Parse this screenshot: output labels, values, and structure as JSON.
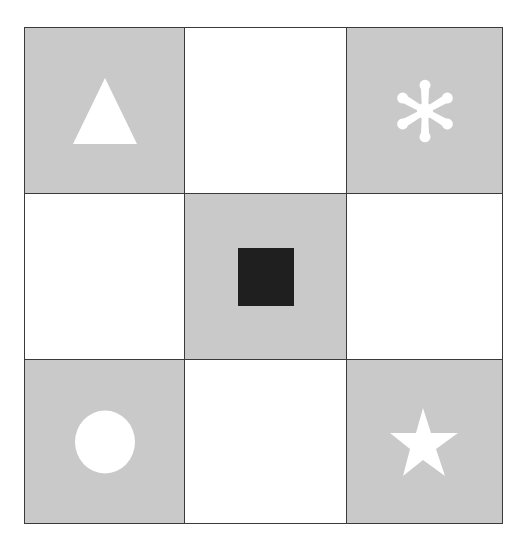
{
  "grid": {
    "rows": 3,
    "cols": 3,
    "colors": {
      "shaded": "#c9c9c9",
      "blank": "#ffffff",
      "border": "#3a3a3a",
      "symbol_light": "#ffffff",
      "symbol_dark": "#1f1f1f"
    },
    "cells": [
      {
        "row": 1,
        "col": 1,
        "fill": "shaded",
        "symbol": "triangle"
      },
      {
        "row": 1,
        "col": 2,
        "fill": "blank",
        "symbol": null
      },
      {
        "row": 1,
        "col": 3,
        "fill": "shaded",
        "symbol": "asterisk"
      },
      {
        "row": 2,
        "col": 1,
        "fill": "blank",
        "symbol": null
      },
      {
        "row": 2,
        "col": 2,
        "fill": "shaded",
        "symbol": "square"
      },
      {
        "row": 2,
        "col": 3,
        "fill": "blank",
        "symbol": null
      },
      {
        "row": 3,
        "col": 1,
        "fill": "shaded",
        "symbol": "circle"
      },
      {
        "row": 3,
        "col": 2,
        "fill": "blank",
        "symbol": null
      },
      {
        "row": 3,
        "col": 3,
        "fill": "shaded",
        "symbol": "star"
      }
    ]
  }
}
